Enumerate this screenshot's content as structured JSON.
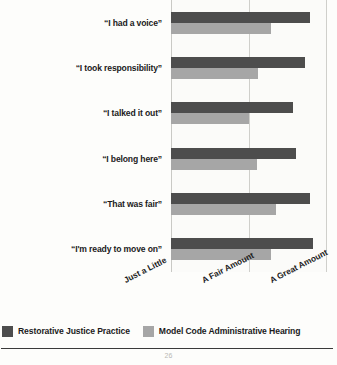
{
  "chart_data": {
    "type": "bar",
    "orientation": "horizontal",
    "title": "",
    "subtitle": "",
    "xlabel": "",
    "ylabel": "",
    "categories": [
      "“I had a voice”",
      "“I took responsibility”",
      "“I talked it out”",
      "“I belong here”",
      "“That was fair”",
      "“I'm ready to move on”"
    ],
    "series": [
      {
        "name": "Restorative Justice Practice",
        "color": "#4d4d4d",
        "values": [
          0.89,
          0.86,
          0.78,
          0.8,
          0.89,
          0.91
        ]
      },
      {
        "name": "Model Code Administrative Hearing",
        "color": "#a6a6a6",
        "values": [
          0.64,
          0.56,
          0.5,
          0.55,
          0.67,
          0.64
        ]
      }
    ],
    "x_tick_labels": [
      "Just a Little",
      "A Fair Amount",
      "A Great Amount"
    ],
    "x_tick_values": [
      0,
      0.5,
      1
    ],
    "xlim": [
      0,
      1
    ],
    "grid": true,
    "gridlines": "vertical",
    "legend_position": "bottom",
    "legend": [
      {
        "label": "Restorative Justice Practice",
        "color": "#4d4d4d"
      },
      {
        "label": "Model Code Administrative Hearing",
        "color": "#a6a6a6"
      }
    ]
  },
  "footer": {
    "page_number": "26"
  }
}
